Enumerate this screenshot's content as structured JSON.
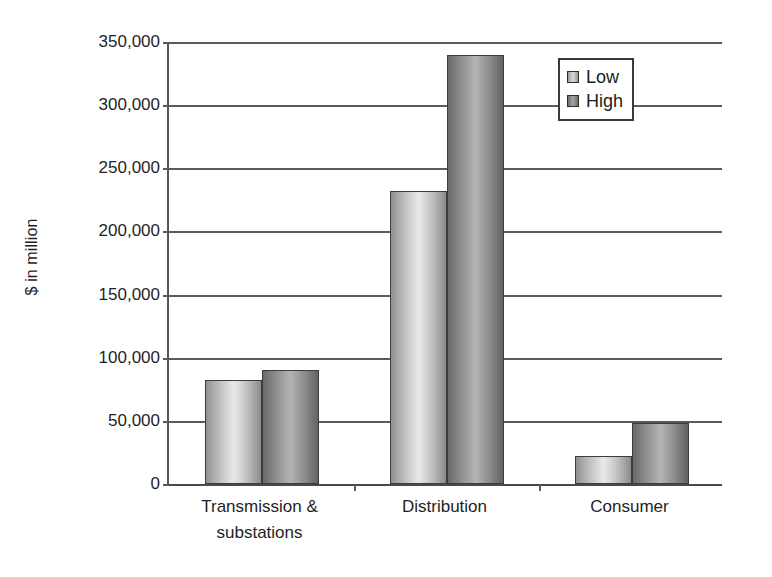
{
  "chart_data": {
    "type": "bar",
    "title": "",
    "subtitle": "",
    "xlabel": "",
    "ylabel": "$ in million",
    "categories": [
      "Transmission & substations",
      "Distribution",
      "Consumer"
    ],
    "category_lines": [
      [
        "Transmission &",
        "substations"
      ],
      [
        "Distribution"
      ],
      [
        "Consumer"
      ]
    ],
    "series": [
      {
        "name": "Low",
        "values": [
          82000,
          232000,
          22000
        ],
        "color": "#d9d9d9"
      },
      {
        "name": "High",
        "values": [
          90000,
          340000,
          48000
        ],
        "color": "#8c8c8c"
      }
    ],
    "ylim": [
      0,
      350000
    ],
    "ytick_step": 50000,
    "yticks": [
      0,
      50000,
      100000,
      150000,
      200000,
      250000,
      300000,
      350000
    ],
    "ytick_labels": [
      "0",
      "50,000",
      "100,000",
      "150,000",
      "200,000",
      "250,000",
      "300,000",
      "350,000"
    ],
    "grid": true,
    "grid_axis": "y",
    "legend": {
      "position": "upper-right-inside",
      "entries": [
        "Low",
        "High"
      ]
    },
    "plot_background": "#ffffff",
    "axis_color": "#5a5a5a"
  }
}
